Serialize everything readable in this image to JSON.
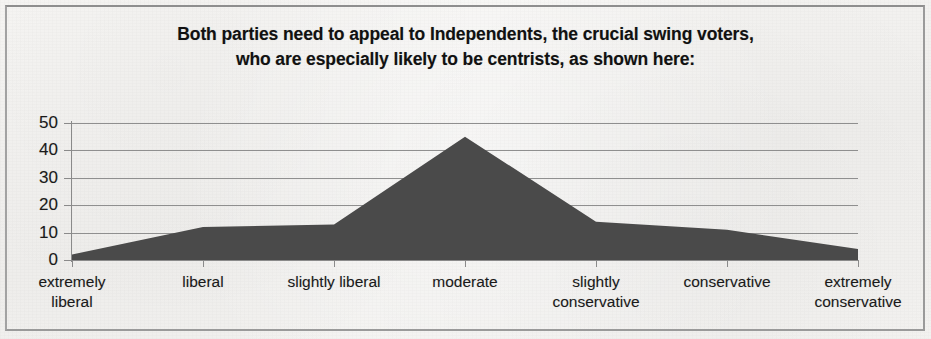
{
  "figure": {
    "frame_color": "#9a9a9a",
    "background_color": "#f4f3f1"
  },
  "title": {
    "line1": "Both parties need to appeal to Independents, the crucial swing voters,",
    "line2": "who are especially likely to be centrists, as shown here:"
  },
  "axis": {
    "y_ticks": [
      "50",
      "40",
      "30",
      "20",
      "10",
      "0"
    ]
  },
  "chart_data": {
    "type": "area",
    "title": "Both parties need to appeal to Independents, the crucial swing voters, who are especially likely to be centrists, as shown here:",
    "xlabel": "",
    "ylabel": "",
    "categories": [
      "extremely liberal",
      "liberal",
      "slightly liberal",
      "moderate",
      "slightly conservative",
      "conservative",
      "extremely conservative"
    ],
    "category_lines": [
      [
        "extremely",
        "liberal"
      ],
      [
        "liberal"
      ],
      [
        "slightly liberal"
      ],
      [
        "moderate"
      ],
      [
        "slightly",
        "conservative"
      ],
      [
        "conservative"
      ],
      [
        "extremely",
        "conservative"
      ]
    ],
    "values": [
      2,
      12,
      13,
      45,
      14,
      11,
      4
    ],
    "series": [
      {
        "name": "ideology distribution",
        "values": [
          2,
          12,
          13,
          45,
          14,
          11,
          4
        ],
        "fill_color": "#4a4a4a"
      }
    ],
    "ylim": [
      0,
      50
    ],
    "ytick_step": 10,
    "grid": "horizontal",
    "legend": "none"
  }
}
